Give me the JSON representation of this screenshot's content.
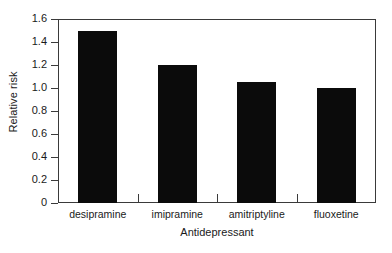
{
  "chart_data": {
    "type": "bar",
    "title": "",
    "xlabel": "Antidepressant",
    "ylabel": "Relative risk",
    "categories": [
      "desipramine",
      "imipramine",
      "amitriptyline",
      "fluoxetine"
    ],
    "values": [
      1.5,
      1.2,
      1.05,
      1.0
    ],
    "ylim": [
      0,
      1.6
    ],
    "ytick_labels": [
      "0",
      "0.2",
      "0.4",
      "0.6",
      "0.8",
      "1.0",
      "1.2",
      "1.4",
      "1.6"
    ],
    "ytick_values": [
      0,
      0.2,
      0.4,
      0.6,
      0.8,
      1.0,
      1.2,
      1.4,
      1.6
    ],
    "grid": false,
    "legend": false,
    "bar_color": "#0b0b0b",
    "axis_color": "#3a3a3a",
    "background_color": "#ffffff"
  },
  "axes": {
    "y_title": "Relative risk",
    "x_title": "Antidepressant"
  },
  "yticks": [
    {
      "label": "1.6",
      "value": 1.6
    },
    {
      "label": "1.4",
      "value": 1.4
    },
    {
      "label": "1.2",
      "value": 1.2
    },
    {
      "label": "1.0",
      "value": 1.0
    },
    {
      "label": "0.8",
      "value": 0.8
    },
    {
      "label": "0.6",
      "value": 0.6
    },
    {
      "label": "0.4",
      "value": 0.4
    },
    {
      "label": "0.2",
      "value": 0.2
    },
    {
      "label": "0",
      "value": 0
    }
  ],
  "bars": [
    {
      "label": "desipramine",
      "value": 1.5
    },
    {
      "label": "imipramine",
      "value": 1.2
    },
    {
      "label": "amitriptyline",
      "value": 1.05
    },
    {
      "label": "fluoxetine",
      "value": 1.0
    }
  ]
}
